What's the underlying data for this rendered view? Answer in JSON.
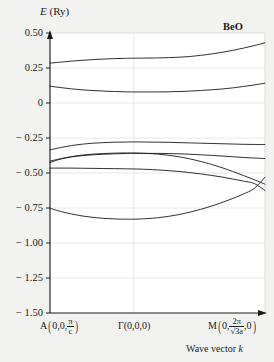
{
  "figure": {
    "material_label": "BeO",
    "y_axis_title_symbol": "E",
    "y_axis_title_unit": "(Ry)",
    "x_axis_title_prefix": "Wave vector",
    "x_axis_title_symbol": "k",
    "line_color": "#1a1a1a",
    "grid_color": "#e3e3e1",
    "background": "#f2f2f0",
    "plot_background": "#ffffff"
  },
  "y_ticks": [
    "0.50",
    "0.25",
    "0",
    "− 0.25",
    "− 0.50",
    "− 0.75",
    "− 1.00",
    "− 1.25",
    "− 1.50"
  ],
  "k_points": [
    {
      "symbol": "A",
      "coord_1": "0,0,",
      "frac_num": "π",
      "frac_den": "c",
      "coord_tail": ""
    },
    {
      "symbol": "Γ",
      "plain": "(0,0,0)"
    },
    {
      "symbol": "M",
      "coord_1": "0,",
      "frac_num": "2π",
      "frac_den": "√3a",
      "coord_tail": ",0"
    }
  ],
  "chart_data": {
    "type": "line",
    "title": "BeO",
    "xlabel": "Wave vector k",
    "ylabel": "E (Ry)",
    "ylim": [
      -1.5,
      0.5
    ],
    "yticks": [
      0.5,
      0.25,
      0,
      -0.25,
      -0.5,
      -0.75,
      -1.0,
      -1.25,
      -1.5
    ],
    "grid": true,
    "legend": "none",
    "x_tick_labels": [
      "A(0,0,π/c)",
      "Γ(0,0,0)",
      "M(0,2π/√3a,0)"
    ],
    "x_tick_positions": [
      0.0,
      0.39,
      1.0
    ],
    "x": [
      0.0,
      0.05,
      0.1,
      0.15,
      0.2,
      0.25,
      0.3,
      0.35,
      0.39,
      0.45,
      0.5,
      0.55,
      0.6,
      0.65,
      0.7,
      0.75,
      0.8,
      0.85,
      0.9,
      0.95,
      1.0
    ],
    "series": [
      {
        "name": "conduction-band-1",
        "values": [
          0.285,
          0.292,
          0.299,
          0.305,
          0.31,
          0.314,
          0.317,
          0.319,
          0.32,
          0.321,
          0.322,
          0.324,
          0.327,
          0.332,
          0.34,
          0.35,
          0.362,
          0.376,
          0.392,
          0.41,
          0.43
        ]
      },
      {
        "name": "conduction-band-2",
        "values": [
          0.12,
          0.11,
          0.101,
          0.094,
          0.089,
          0.085,
          0.082,
          0.08,
          0.079,
          0.079,
          0.079,
          0.08,
          0.082,
          0.085,
          0.089,
          0.094,
          0.1,
          0.108,
          0.118,
          0.129,
          0.142
        ]
      },
      {
        "name": "valence-band-1",
        "values": [
          -0.335,
          -0.318,
          -0.304,
          -0.294,
          -0.287,
          -0.283,
          -0.28,
          -0.279,
          -0.278,
          -0.279,
          -0.28,
          -0.281,
          -0.283,
          -0.285,
          -0.287,
          -0.289,
          -0.291,
          -0.293,
          -0.295,
          -0.296,
          -0.297
        ]
      },
      {
        "name": "valence-band-2",
        "values": [
          -0.415,
          -0.398,
          -0.385,
          -0.376,
          -0.37,
          -0.366,
          -0.363,
          -0.361,
          -0.36,
          -0.36,
          -0.36,
          -0.361,
          -0.363,
          -0.366,
          -0.37,
          -0.374,
          -0.379,
          -0.384,
          -0.389,
          -0.393,
          -0.397
        ]
      },
      {
        "name": "valence-band-3",
        "values": [
          -0.425,
          -0.4,
          -0.383,
          -0.372,
          -0.365,
          -0.361,
          -0.358,
          -0.357,
          -0.357,
          -0.36,
          -0.365,
          -0.373,
          -0.384,
          -0.399,
          -0.417,
          -0.438,
          -0.462,
          -0.489,
          -0.518,
          -0.548,
          -0.58
        ]
      },
      {
        "name": "valence-band-4",
        "values": [
          -0.465,
          -0.465,
          -0.465,
          -0.466,
          -0.467,
          -0.468,
          -0.469,
          -0.47,
          -0.471,
          -0.474,
          -0.478,
          -0.483,
          -0.489,
          -0.497,
          -0.506,
          -0.517,
          -0.529,
          -0.543,
          -0.558,
          -0.575,
          -0.625
        ]
      },
      {
        "name": "valence-band-5-deep",
        "values": [
          -0.752,
          -0.775,
          -0.793,
          -0.807,
          -0.817,
          -0.824,
          -0.828,
          -0.83,
          -0.83,
          -0.826,
          -0.82,
          -0.81,
          -0.797,
          -0.78,
          -0.76,
          -0.737,
          -0.711,
          -0.682,
          -0.65,
          -0.61,
          -0.53
        ]
      }
    ]
  }
}
